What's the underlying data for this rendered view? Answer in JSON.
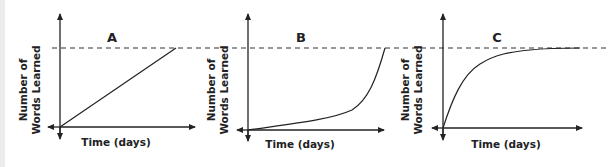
{
  "figure": {
    "reference_line": "dashed horizontal line marking a common maximum",
    "panels": [
      {
        "label": "A",
        "xlabel": "Time (days)",
        "ylabel_line1": "Number of",
        "ylabel_line2": "Words Learned",
        "shape": "linear"
      },
      {
        "label": "B",
        "xlabel": "Time (days)",
        "ylabel_line1": "Number of",
        "ylabel_line2": "Words Learned",
        "shape": "exponential growth"
      },
      {
        "label": "C",
        "xlabel": "Time (days)",
        "ylabel_line1": "Number of",
        "ylabel_line2": "Words Learned",
        "shape": "rapid rise then plateau"
      }
    ]
  },
  "colors": {
    "line": "#222222",
    "background": "#ffffff"
  }
}
